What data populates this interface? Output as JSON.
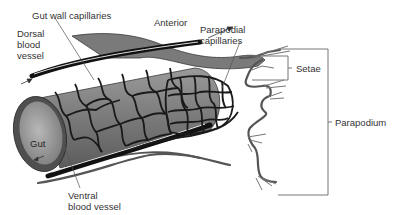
{
  "diagram": {
    "type": "anatomical-illustration",
    "labels": {
      "gut_wall_capillaries": "Gut wall capillaries",
      "anterior": "Anterior",
      "dorsal_blood_vessel": "Dorsal\nblood\nvessel",
      "parapodial_capillaries": "Parapodial\ncapillaries",
      "setae": "Setae",
      "gut": "Gut",
      "parapodium": "Parapodium",
      "ventral_blood_vessel": "Ventral\nblood vessel"
    },
    "colors": {
      "vessel": "#1a1a1a",
      "gut_fill": "#8a8a8a",
      "gut_rim": "#5a5a5a",
      "body_wall": "#6b6b6b",
      "leader_line": "#555555",
      "bracket": "#777777",
      "text": "#333333"
    }
  }
}
